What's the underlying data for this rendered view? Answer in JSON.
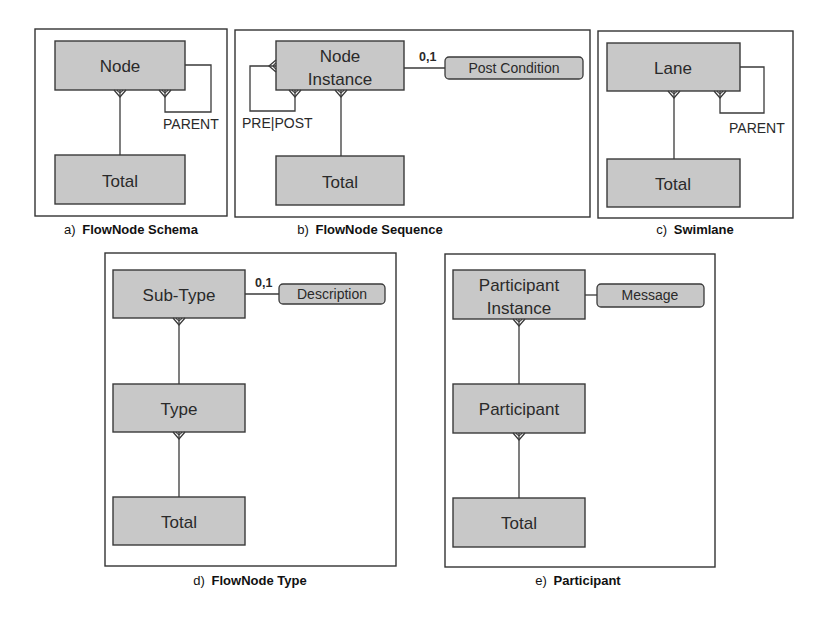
{
  "figure": {
    "panels": [
      {
        "id": "a",
        "caption_prefix": "a)",
        "caption": "FlowNode Schema",
        "entities": [
          "Node",
          "Total"
        ],
        "relationships": [
          {
            "from": "Total",
            "to": "Node",
            "cardinality": "one-to-many"
          },
          {
            "from": "Node",
            "to": "Node",
            "role": "PARENT",
            "cardinality": "self-many"
          }
        ],
        "labels": {
          "role": "PARENT"
        }
      },
      {
        "id": "b",
        "caption_prefix": "b)",
        "caption": "FlowNode Sequence",
        "entities": [
          "Node Instance",
          "Total"
        ],
        "entity_lines": {
          "node_instance": [
            "Node",
            "Instance"
          ]
        },
        "attributes": [
          "Post Condition"
        ],
        "relationships": [
          {
            "from": "Total",
            "to": "Node Instance",
            "cardinality": "one-to-many"
          },
          {
            "from": "Node Instance",
            "to": "Node Instance",
            "role": "PRE|POST",
            "cardinality": "many-to-many"
          },
          {
            "from": "Node Instance",
            "to": "Post Condition",
            "cardinality": "0,1"
          }
        ],
        "labels": {
          "role": "PRE|POST",
          "cardinality": "0,1"
        }
      },
      {
        "id": "c",
        "caption_prefix": "c)",
        "caption": "Swimlane",
        "entities": [
          "Lane",
          "Total"
        ],
        "relationships": [
          {
            "from": "Total",
            "to": "Lane",
            "cardinality": "one-to-many"
          },
          {
            "from": "Lane",
            "to": "Lane",
            "role": "PARENT",
            "cardinality": "self-many"
          }
        ],
        "labels": {
          "role": "PARENT"
        }
      },
      {
        "id": "d",
        "caption_prefix": "d)",
        "caption": "FlowNode Type",
        "entities": [
          "Sub-Type",
          "Type",
          "Total"
        ],
        "attributes": [
          "Description"
        ],
        "relationships": [
          {
            "from": "Type",
            "to": "Sub-Type",
            "cardinality": "one-to-many"
          },
          {
            "from": "Total",
            "to": "Type",
            "cardinality": "one-to-many"
          },
          {
            "from": "Sub-Type",
            "to": "Description",
            "cardinality": "0,1"
          }
        ],
        "labels": {
          "cardinality": "0,1"
        }
      },
      {
        "id": "e",
        "caption_prefix": "e)",
        "caption": "Participant",
        "entities": [
          "Participant Instance",
          "Participant",
          "Total"
        ],
        "entity_lines": {
          "participant_instance": [
            "Participant",
            "Instance"
          ]
        },
        "attributes": [
          "Message"
        ],
        "relationships": [
          {
            "from": "Participant",
            "to": "Participant Instance",
            "cardinality": "one-to-many"
          },
          {
            "from": "Total",
            "to": "Participant",
            "cardinality": "one-to-many"
          },
          {
            "from": "Participant Instance",
            "to": "Message",
            "cardinality": "one"
          }
        ]
      }
    ],
    "colors": {
      "entity_fill": "#c8c8c8",
      "stroke": "#3a3a3a",
      "background": "#ffffff"
    }
  }
}
